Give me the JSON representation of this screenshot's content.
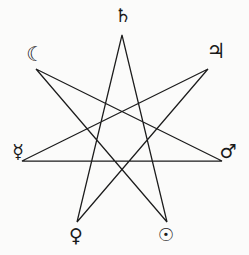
{
  "figure": {
    "background_color": "#fbfbfa",
    "stroke_color": "#1c1c1c",
    "stroke_width": 1.25,
    "width": 249,
    "height": 255
  },
  "star": {
    "type": "heptagram",
    "schlafli": "{7/3}",
    "points": 7,
    "step": 3,
    "center": {
      "x": 122,
      "y": 146
    },
    "radius": 111,
    "rotation_deg": -90,
    "vertices": [
      {
        "index": 0,
        "name": "saturn",
        "x": 122,
        "y": 35
      },
      {
        "index": 1,
        "name": "jupiter",
        "x": 208,
        "y": 69
      },
      {
        "index": 2,
        "name": "mars",
        "x": 222,
        "y": 161
      },
      {
        "index": 3,
        "name": "sun",
        "x": 167,
        "y": 222
      },
      {
        "index": 4,
        "name": "venus",
        "x": 77,
        "y": 222
      },
      {
        "index": 5,
        "name": "mercury",
        "x": 22,
        "y": 161
      },
      {
        "index": 6,
        "name": "moon",
        "x": 36,
        "y": 69
      }
    ],
    "edge_order": [
      0,
      3,
      6,
      2,
      5,
      1,
      4,
      0
    ]
  },
  "labels": {
    "saturn": {
      "glyph": "♄",
      "name": "saturn-symbol",
      "title": "Saturn"
    },
    "jupiter": {
      "glyph": "♃",
      "name": "jupiter-symbol",
      "title": "Jupiter"
    },
    "mars": {
      "glyph": "♂",
      "name": "mars-symbol",
      "title": "Mars"
    },
    "sun": {
      "glyph": "☉",
      "name": "sun-symbol",
      "title": "Sun"
    },
    "venus": {
      "glyph": "♀",
      "name": "venus-symbol",
      "title": "Venus"
    },
    "mercury": {
      "glyph": "☿",
      "name": "mercury-symbol",
      "title": "Mercury"
    },
    "moon": {
      "glyph": "☾",
      "name": "moon-symbol",
      "title": "Moon"
    }
  }
}
